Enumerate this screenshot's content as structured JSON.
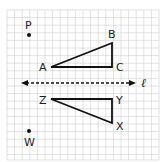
{
  "diagram": {
    "type": "coordinate-grid-reflection",
    "grid": {
      "x0": 7,
      "y0": 10,
      "x1": 160,
      "y1": 160,
      "cell": 7.6,
      "color": "#c8c8c8"
    },
    "line": {
      "label": "ℓ",
      "style": "dashed",
      "arrows": "both"
    },
    "points": [
      {
        "label": "P",
        "role": "point"
      },
      {
        "label": "W",
        "role": "point"
      }
    ],
    "triangles": [
      {
        "name": "ABC",
        "vertices": [
          "A",
          "B",
          "C"
        ]
      },
      {
        "name": "ZYX",
        "vertices": [
          "Z",
          "Y",
          "X"
        ]
      }
    ],
    "labels": {
      "P": "P",
      "W": "W",
      "A": "A",
      "B": "B",
      "C": "C",
      "X": "X",
      "Y": "Y",
      "Z": "Z",
      "line": "ℓ"
    }
  }
}
